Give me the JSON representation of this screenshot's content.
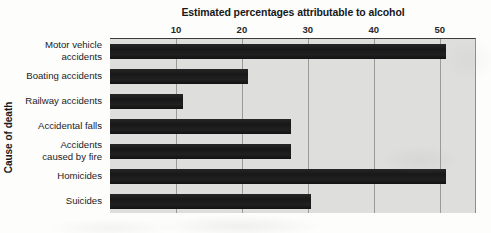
{
  "chart_data": {
    "type": "bar",
    "orientation": "horizontal",
    "title": "Estimated percentages attributable to alcohol",
    "xlabel": "",
    "ylabel": "Cause of death",
    "categories": [
      "Motor vehicle\naccidents",
      "Boating accidents",
      "Railway accidents",
      "Accidental falls",
      "Accidents\ncaused by fire",
      "Homicides",
      "Suicides"
    ],
    "values": [
      51,
      21,
      11,
      27.5,
      27.5,
      51,
      30.5
    ],
    "xlim": [
      0,
      55.5
    ],
    "xticks": [
      10,
      20,
      30,
      40,
      50
    ],
    "xtick_labels": [
      "10",
      "20",
      "30",
      "40",
      "50"
    ],
    "grid": "vertical",
    "legend": "none",
    "bar_color": "#1d1d1d",
    "plot_background": "#dededc",
    "axis_color": "#3a3a3a",
    "gridline_color": "#9a9a97"
  }
}
